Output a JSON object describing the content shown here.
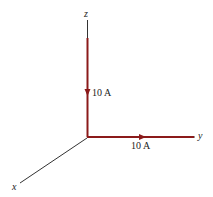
{
  "diagram": {
    "axes": {
      "x_label": "x",
      "y_label": "y",
      "z_label": "z"
    },
    "currents": [
      {
        "id": "z-segment",
        "label": "10 A",
        "direction": "down (-z toward origin)"
      },
      {
        "id": "y-segment",
        "label": "10 A",
        "direction": "+y (away from origin)"
      }
    ],
    "colors": {
      "wire": "#8b1a1a",
      "axis": "#333333",
      "text": "#222222"
    }
  }
}
